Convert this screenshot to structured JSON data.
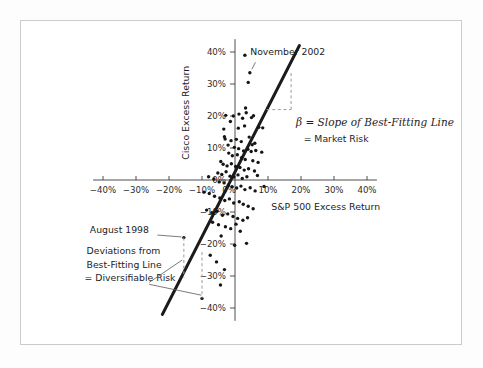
{
  "chart_data": {
    "type": "scatter",
    "title": "",
    "xlabel": "S&P 500 Excess Return",
    "ylabel": "Cisco Excess Return",
    "xlim": [
      -45,
      45
    ],
    "ylim": [
      -45,
      45
    ],
    "grid": false,
    "legend": "none",
    "x_tick_labels": [
      "-40%",
      "-30%",
      "-20%",
      "-10%",
      "0%",
      "10%",
      "20%",
      "30%",
      "40%"
    ],
    "x_tick_values": [
      -40,
      -30,
      -20,
      -10,
      0,
      10,
      20,
      30,
      40
    ],
    "y_tick_labels": [
      "40%",
      "30%",
      "20%",
      "10%",
      "0%",
      "-10%",
      "-20%",
      "-30%",
      "-40%"
    ],
    "y_tick_values": [
      40,
      30,
      20,
      10,
      0,
      -10,
      -20,
      -30,
      -40
    ],
    "series": [
      {
        "name": "Cisco monthly excess return vs S&P 500 excess return",
        "marker": "filled-circle",
        "color": "#151515",
        "points": [
          [
            3.0,
            39.0
          ],
          [
            4.5,
            33.5
          ],
          [
            4.0,
            30.5
          ],
          [
            3.2,
            22.5
          ],
          [
            -2.8,
            20.2
          ],
          [
            -0.5,
            20.0
          ],
          [
            1.2,
            20.6
          ],
          [
            2.3,
            19.3
          ],
          [
            3.4,
            21.0
          ],
          [
            5.0,
            19.5
          ],
          [
            5.6,
            20.1
          ],
          [
            -1.4,
            18.3
          ],
          [
            2.9,
            16.9
          ],
          [
            1.0,
            16.2
          ],
          [
            7.2,
            16.5
          ],
          [
            8.4,
            16.3
          ],
          [
            -3.4,
            15.9
          ],
          [
            -3.2,
            13.5
          ],
          [
            -3.0,
            12.8
          ],
          [
            -1.2,
            12.3
          ],
          [
            0.4,
            12.7
          ],
          [
            1.9,
            12.0
          ],
          [
            4.3,
            13.4
          ],
          [
            5.2,
            11.0
          ],
          [
            6.0,
            11.5
          ],
          [
            -2.1,
            10.9
          ],
          [
            -0.2,
            10.2
          ],
          [
            1.1,
            9.8
          ],
          [
            2.6,
            9.1
          ],
          [
            3.9,
            9.6
          ],
          [
            4.9,
            8.9
          ],
          [
            6.3,
            9.2
          ],
          [
            8.1,
            8.7
          ],
          [
            -1.9,
            8.4
          ],
          [
            -0.8,
            7.6
          ],
          [
            0.7,
            7.9
          ],
          [
            2.0,
            7.0
          ],
          [
            3.1,
            6.4
          ],
          [
            5.4,
            6.0
          ],
          [
            7.0,
            5.5
          ],
          [
            -4.3,
            5.8
          ],
          [
            -3.6,
            4.9
          ],
          [
            -2.4,
            4.4
          ],
          [
            -1.1,
            5.1
          ],
          [
            0.2,
            4.2
          ],
          [
            1.5,
            3.9
          ],
          [
            2.8,
            3.1
          ],
          [
            4.1,
            3.5
          ],
          [
            5.9,
            2.8
          ],
          [
            -5.2,
            2.2
          ],
          [
            -4.0,
            1.7
          ],
          [
            -2.7,
            2.6
          ],
          [
            -1.5,
            1.2
          ],
          [
            -0.3,
            0.9
          ],
          [
            0.9,
            1.6
          ],
          [
            2.2,
            0.5
          ],
          [
            3.6,
            1.0
          ],
          [
            6.8,
            1.4
          ],
          [
            -8.0,
            1.0
          ],
          [
            -6.4,
            0.3
          ],
          [
            -4.8,
            -0.6
          ],
          [
            -3.3,
            -0.9
          ],
          [
            -2.0,
            -1.6
          ],
          [
            -0.9,
            -2.1
          ],
          [
            0.5,
            -2.5
          ],
          [
            1.8,
            -1.9
          ],
          [
            3.0,
            -3.0
          ],
          [
            4.6,
            -2.4
          ],
          [
            6.1,
            -3.4
          ],
          [
            8.8,
            -2.0
          ],
          [
            -9.4,
            -3.8
          ],
          [
            -7.8,
            -4.2
          ],
          [
            -6.2,
            -5.1
          ],
          [
            -4.6,
            -5.6
          ],
          [
            -3.1,
            -6.4
          ],
          [
            -1.7,
            -5.9
          ],
          [
            -0.4,
            -7.2
          ],
          [
            1.3,
            -6.8
          ],
          [
            2.5,
            -7.6
          ],
          [
            4.0,
            -8.2
          ],
          [
            5.5,
            -9.0
          ],
          [
            -8.6,
            -9.4
          ],
          [
            -7.0,
            -10.2
          ],
          [
            -5.4,
            -9.8
          ],
          [
            -3.8,
            -11.0
          ],
          [
            -2.2,
            -10.6
          ],
          [
            -0.6,
            -11.4
          ],
          [
            0.8,
            -12.0
          ],
          [
            2.4,
            -12.6
          ],
          [
            3.8,
            -11.8
          ],
          [
            -6.8,
            -13.2
          ],
          [
            -5.0,
            -14.0
          ],
          [
            -2.9,
            -14.6
          ],
          [
            -1.3,
            -15.2
          ],
          [
            0.3,
            -13.8
          ],
          [
            1.6,
            -16.0
          ],
          [
            -4.2,
            -17.5
          ],
          [
            -0.1,
            -20.4
          ],
          [
            3.5,
            -19.8
          ],
          [
            -7.5,
            -23.5
          ],
          [
            -5.6,
            -25.6
          ],
          [
            -3.2,
            -28.0
          ],
          [
            -4.4,
            -32.8
          ],
          [
            -15.5,
            -18.0
          ],
          [
            -10.0,
            -37.0
          ]
        ]
      }
    ],
    "annotations": [
      {
        "name": "november-2002",
        "text": "November 2002",
        "points_to_value": [
          4.5,
          33.5
        ]
      },
      {
        "name": "august-1998",
        "text": "August 1998",
        "points_to_value": [
          -15.5,
          -18.0
        ]
      },
      {
        "name": "beta-definition",
        "line1": "β = Slope of Best-Fitting Line",
        "line2": "= Market Risk"
      },
      {
        "name": "deviations-definition",
        "line1": "Deviations from",
        "line2": "Best-Fitting Line",
        "line3": "= Diversifiable Risk"
      }
    ],
    "fit_line": {
      "name": "best-fitting-line",
      "slope_note": "steeper than 1 (beta > 1)",
      "x_start": -22.0,
      "y_start": -42.0,
      "x_end": 19.5,
      "y_end": 42.0
    }
  },
  "labels": {
    "x_axis_title": "S&P 500 Excess Return",
    "y_axis_title": "Cisco Excess Return"
  }
}
